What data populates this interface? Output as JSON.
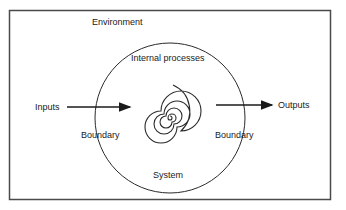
{
  "diagram": {
    "type": "system-environment-diagram",
    "labels": {
      "environment": "Environment",
      "internal_processes": "Internal processes",
      "inputs": "Inputs",
      "outputs": "Outputs",
      "boundary_left": "Boundary",
      "boundary_right": "Boundary",
      "system": "System"
    },
    "colors": {
      "stroke": "#2a2a2a",
      "frame": "#4a4a4a",
      "text": "#1a1a1a",
      "background": "#ffffff"
    },
    "nodes": [
      {
        "id": "environment",
        "shape": "rectangle",
        "label": "Environment"
      },
      {
        "id": "system",
        "shape": "circle",
        "label": "System"
      },
      {
        "id": "internal",
        "shape": "spiral",
        "label": "Internal processes"
      }
    ],
    "edges": [
      {
        "from": "Inputs",
        "to": "system",
        "label": "Inputs",
        "direction": "right"
      },
      {
        "from": "system",
        "to": "Outputs",
        "label": "Outputs",
        "direction": "right"
      }
    ]
  }
}
